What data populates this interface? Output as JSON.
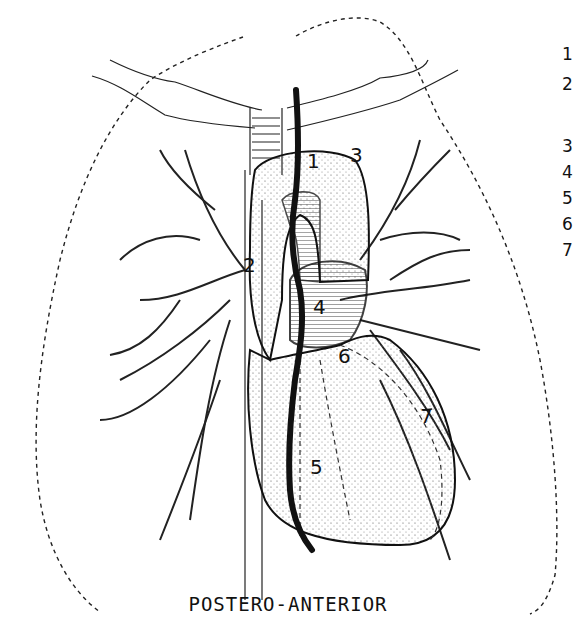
{
  "figure": {
    "caption": "POSTERO-ANTERIOR",
    "view": "postero-anterior chest illustration",
    "colors": {
      "ink": "#111111",
      "background": "#ffffff",
      "stipple": "#555555"
    }
  },
  "labels": [
    {
      "id": "1",
      "text": "1",
      "x": 307,
      "y": 168
    },
    {
      "id": "2",
      "text": "2",
      "x": 243,
      "y": 272
    },
    {
      "id": "3",
      "text": "3",
      "x": 350,
      "y": 162
    },
    {
      "id": "4",
      "text": "4",
      "x": 313,
      "y": 314
    },
    {
      "id": "5",
      "text": "5",
      "x": 310,
      "y": 474
    },
    {
      "id": "6",
      "text": "6",
      "x": 338,
      "y": 363
    },
    {
      "id": "7",
      "text": "7",
      "x": 420,
      "y": 423
    }
  ],
  "legend_numbers_truncated": [
    {
      "text": "1",
      "top": 0
    },
    {
      "text": "2",
      "top": 30
    },
    {
      "text": "3",
      "top": 92
    },
    {
      "text": "4",
      "top": 118
    },
    {
      "text": "5",
      "top": 144
    },
    {
      "text": "6",
      "top": 170
    },
    {
      "text": "7",
      "top": 196
    }
  ]
}
